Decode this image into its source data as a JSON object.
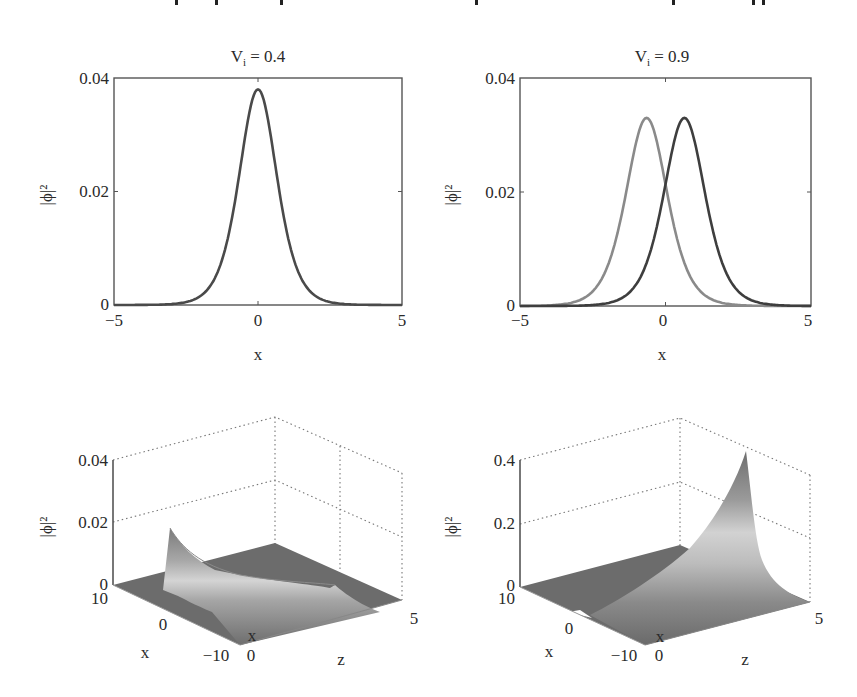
{
  "page": {
    "cropped_text_fragments_x": [
      175,
      215,
      280,
      475,
      672,
      752,
      762
    ]
  },
  "chart_data": [
    {
      "id": "top-left",
      "type": "line",
      "title": "V_i = 0.4",
      "title_main": "V",
      "title_sub": "i",
      "title_rest": " = 0.4",
      "xlabel": "x",
      "ylabel": "|ϕ|²",
      "xlim": [
        -5,
        5
      ],
      "ylim": [
        0,
        0.04
      ],
      "xticks": [
        "−5",
        "0",
        "5"
      ],
      "yticks": [
        "0",
        "0.02",
        "0.04"
      ],
      "series": [
        {
          "name": "|ϕ|² (single soliton)",
          "color": "#4a4a4a",
          "center": 0.0,
          "peak": 0.038,
          "width": 0.88
        }
      ]
    },
    {
      "id": "top-right",
      "type": "line",
      "title": "V_i = 0.9",
      "title_main": "V",
      "title_sub": "i",
      "title_rest": " = 0.9",
      "xlabel": "x",
      "ylabel": "|ϕ|²",
      "xlim": [
        -5,
        5
      ],
      "ylim": [
        0,
        0.04
      ],
      "xticks": [
        "−5",
        "0",
        "5"
      ],
      "yticks": [
        "0",
        "0.02",
        "0.04"
      ],
      "series": [
        {
          "name": "component 1",
          "color": "#8a8a8a",
          "center": -0.65,
          "peak": 0.033,
          "width": 0.95
        },
        {
          "name": "component 2",
          "color": "#3e3e3e",
          "center": 0.65,
          "peak": 0.033,
          "width": 0.95
        }
      ]
    },
    {
      "id": "bottom-left",
      "type": "surface",
      "xlabel": "x",
      "ylabel": "z",
      "zlabel": "|ϕ|²",
      "xlim": [
        -10,
        10
      ],
      "ylim": [
        0,
        5
      ],
      "zlim": [
        0,
        0.04
      ],
      "xticks": [
        "10",
        "0",
        "−10"
      ],
      "yticks": [
        "0",
        "5"
      ],
      "zticks": [
        "0",
        "0.02",
        "0.04"
      ],
      "peak_value_at_z0": 0.025,
      "description": "Soliton decays along z from peak ~0.025 at z=0, x≈0"
    },
    {
      "id": "bottom-right",
      "type": "surface",
      "xlabel": "x",
      "ylabel": "z",
      "zlabel": "|ϕ|²",
      "xlim": [
        -10,
        10
      ],
      "ylim": [
        0,
        5
      ],
      "zlim": [
        0,
        0.4
      ],
      "xticks": [
        "10",
        "0",
        "−10"
      ],
      "yticks": [
        "0",
        "5"
      ],
      "zticks": [
        "0",
        "0.2",
        "0.4"
      ],
      "peak_value_at_z5": 0.38,
      "description": "Soliton grows along z reaching ~0.38 at z=5, x≈0"
    }
  ]
}
